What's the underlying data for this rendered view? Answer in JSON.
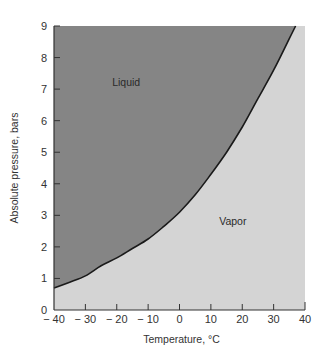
{
  "chart_data": {
    "type": "area",
    "title": "",
    "xlabel": "Temperature, °C",
    "ylabel": "Absolute pressure, bars",
    "xlim": [
      -40,
      40
    ],
    "ylim": [
      0,
      9
    ],
    "xticks": [
      -40,
      -30,
      -20,
      -10,
      0,
      10,
      20,
      30,
      40
    ],
    "xtick_labels": [
      "− 40",
      "− 30",
      "− 20",
      "− 10",
      "0",
      "10",
      "20",
      "30",
      "40"
    ],
    "yticks": [
      0,
      1,
      2,
      3,
      4,
      5,
      6,
      7,
      8,
      9
    ],
    "ytick_labels": [
      "0",
      "1",
      "2",
      "3",
      "4",
      "5",
      "6",
      "7",
      "8",
      "9"
    ],
    "grid": false,
    "legend": null,
    "series": [
      {
        "name": "Saturation curve",
        "x": [
          -40,
          -35,
          -30,
          -25,
          -20,
          -15,
          -10,
          -5,
          0,
          5,
          10,
          15,
          20,
          25,
          30,
          35,
          37
        ],
        "values": [
          0.7,
          0.88,
          1.08,
          1.4,
          1.65,
          1.95,
          2.25,
          2.65,
          3.1,
          3.65,
          4.3,
          5.0,
          5.8,
          6.7,
          7.6,
          8.6,
          9.0
        ]
      }
    ],
    "regions": [
      {
        "name": "Liquid",
        "position": "above curve",
        "color": "#858585"
      },
      {
        "name": "Vapor",
        "position": "below curve",
        "color": "#d4d4d4"
      }
    ],
    "annotations": [
      {
        "text": "Liquid",
        "x": -17,
        "y": 7.1
      },
      {
        "text": "Vapor",
        "x": 17,
        "y": 2.7
      }
    ]
  },
  "labels": {
    "xlabel": "Temperature, °C",
    "ylabel": "Absolute pressure, bars",
    "liquid": "Liquid",
    "vapor": "Vapor"
  },
  "colors": {
    "liquid_fill": "#858585",
    "vapor_fill": "#d4d4d4",
    "curve": "#1a1a1a",
    "axis": "#333333"
  }
}
